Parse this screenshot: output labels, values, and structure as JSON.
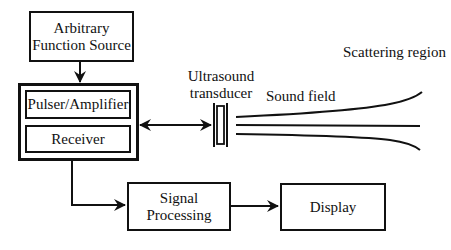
{
  "diagram": {
    "blocks": {
      "function_source": {
        "line1": "Arbitrary",
        "line2": "Function Source"
      },
      "pulser": {
        "label": "Pulser/Amplifier"
      },
      "receiver": {
        "label": "Receiver"
      },
      "signal_processing": {
        "line1": "Signal",
        "line2": "Processing"
      },
      "display": {
        "label": "Display"
      }
    },
    "labels": {
      "transducer_line1": "Ultrasound",
      "transducer_line2": "transducer",
      "sound_field": "Sound field",
      "scattering_region": "Scattering region"
    },
    "edges": [
      {
        "from": "function_source",
        "to": "pulser_receiver_unit",
        "type": "arrow"
      },
      {
        "from": "pulser_receiver_unit",
        "to": "ultrasound_transducer",
        "type": "double-arrow"
      },
      {
        "from": "receiver",
        "to": "signal_processing",
        "type": "arrow"
      },
      {
        "from": "signal_processing",
        "to": "display",
        "type": "arrow"
      }
    ],
    "colors": {
      "stroke": "#111111",
      "background": "#ffffff"
    }
  }
}
